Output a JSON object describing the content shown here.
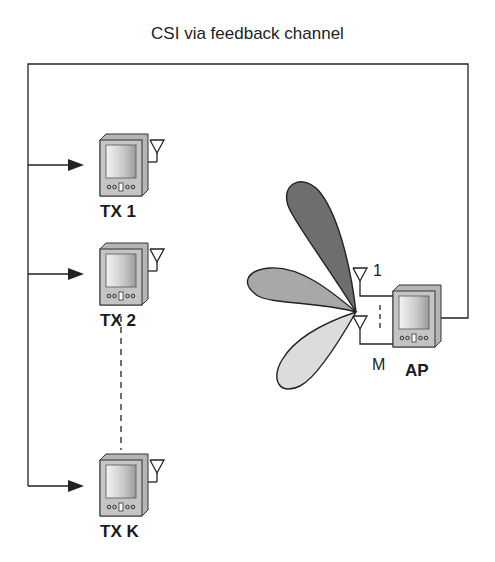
{
  "title": "CSI via feedback channel",
  "transmitters": [
    {
      "label": "TX 1"
    },
    {
      "label": "TX 2"
    },
    {
      "label": "TX K"
    }
  ],
  "access_point": {
    "label": "AP",
    "antenna_first": "1",
    "antenna_last": "M"
  },
  "colors": {
    "line": "#222222",
    "beam_dark": "#6e6e6e",
    "beam_mid": "#a8a8a8",
    "beam_light": "#dcdcdc"
  }
}
